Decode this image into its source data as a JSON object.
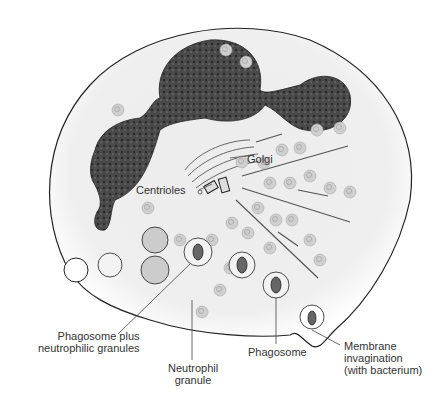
{
  "diagram": {
    "labels": {
      "golgi": "Golgi",
      "centrioles": "Centrioles",
      "phagosome_plus": "Phagosome plus\nneutrophilic granules",
      "neutrophil_granule": "Neutrophil\ngranule",
      "phagosome": "Phagosome",
      "membrane_invagination": "Membrane\ninvagination\n(with bacterium)"
    },
    "colors": {
      "nucleus": "#3a3a3a",
      "cytoplasm": "#ececec",
      "outline": "#222222",
      "granule": "#c8c8c8",
      "background": "#ffffff"
    }
  }
}
